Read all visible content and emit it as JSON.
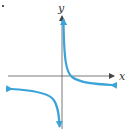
{
  "diagram": {
    "type": "graph-of-function",
    "axes": {
      "x_label": "x",
      "y_label": "y",
      "axis_color": "#555555"
    },
    "curve": {
      "color": "#3aa3d8",
      "branches": [
        "right-upper branch crossing x-axis",
        "left-lower branch"
      ]
    }
  }
}
